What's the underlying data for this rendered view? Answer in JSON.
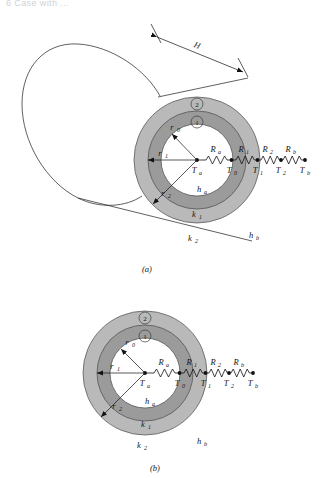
{
  "page": {
    "top_cropped_text": "6  Case with ...",
    "background": "#ffffff"
  },
  "colors": {
    "ring_outer": "#b9b9b9",
    "ring_inner": "#9b9b9b",
    "core": "#ffffff",
    "stroke": "#4a4a4a",
    "ink": "#111111"
  },
  "figures": [
    {
      "id": "figure-a",
      "caption": "(a)",
      "view": "cylinder-perspective",
      "center": {
        "x": 197,
        "y": 160
      },
      "radii": {
        "r0": 36,
        "r1": 49,
        "r2": 63
      },
      "dimension": {
        "label": "H",
        "description": "cylinder length dimension line"
      },
      "region_badges": [
        {
          "label": "1",
          "ring": "inner"
        },
        {
          "label": "2",
          "ring": "outer"
        }
      ],
      "radius_labels": [
        {
          "text": "r",
          "sub": "0"
        },
        {
          "text": "r",
          "sub": "1"
        },
        {
          "text": "r",
          "sub": "2"
        }
      ],
      "material_labels": [
        {
          "text": "h",
          "sub": "a",
          "zone": "core-inner-convection"
        },
        {
          "text": "k",
          "sub": "1",
          "zone": "inner-ring-conduction"
        },
        {
          "text": "k",
          "sub": "2",
          "zone": "outer-ring-conduction"
        },
        {
          "text": "h",
          "sub": "b",
          "zone": "outer-convection"
        }
      ],
      "network": {
        "resistors": [
          {
            "text": "R",
            "sub": "a"
          },
          {
            "text": "R",
            "sub": "1"
          },
          {
            "text": "R",
            "sub": "2"
          },
          {
            "text": "R",
            "sub": "b"
          }
        ],
        "nodes": [
          {
            "text": "T",
            "sub": "a"
          },
          {
            "text": "T",
            "sub": "0"
          },
          {
            "text": "T",
            "sub": "1"
          },
          {
            "text": "T",
            "sub": "2"
          },
          {
            "text": "T",
            "sub": "b"
          }
        ]
      }
    },
    {
      "id": "figure-b",
      "caption": "(b)",
      "view": "cross-section",
      "center": {
        "x": 145,
        "y": 373
      },
      "radii": {
        "r0": 35,
        "r1": 48,
        "r2": 62
      },
      "region_badges": [
        {
          "label": "1",
          "ring": "inner"
        },
        {
          "label": "2",
          "ring": "outer"
        }
      ],
      "radius_labels": [
        {
          "text": "r",
          "sub": "0"
        },
        {
          "text": "r",
          "sub": "1"
        },
        {
          "text": "r",
          "sub": "2"
        }
      ],
      "material_labels": [
        {
          "text": "h",
          "sub": "a",
          "zone": "core-inner-convection"
        },
        {
          "text": "k",
          "sub": "1",
          "zone": "inner-ring-conduction"
        },
        {
          "text": "k",
          "sub": "2",
          "zone": "outer-ring-conduction"
        },
        {
          "text": "h",
          "sub": "b",
          "zone": "outer-convection"
        }
      ],
      "network": {
        "resistors": [
          {
            "text": "R",
            "sub": "a"
          },
          {
            "text": "R",
            "sub": "1"
          },
          {
            "text": "R",
            "sub": "2"
          },
          {
            "text": "R",
            "sub": "b"
          }
        ],
        "nodes": [
          {
            "text": "T",
            "sub": "a"
          },
          {
            "text": "T",
            "sub": "0"
          },
          {
            "text": "T",
            "sub": "1"
          },
          {
            "text": "T",
            "sub": "2"
          },
          {
            "text": "T",
            "sub": "b"
          }
        ]
      }
    }
  ]
}
